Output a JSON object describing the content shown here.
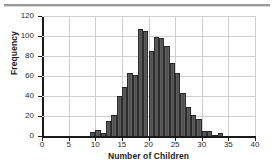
{
  "figure": {
    "background_color": "#ffffff",
    "rule_color": "#9a9a9a"
  },
  "chart_data": {
    "type": "bar",
    "title": "",
    "subtitle": "",
    "xlabel": "Number of Children",
    "ylabel": "Frequency",
    "xlim": [
      0,
      40
    ],
    "ylim": [
      0,
      120
    ],
    "grid": true,
    "legend": null,
    "bar_color": "#4c4c4c",
    "bar_edge_color": "#2b2b2b",
    "bin_width": 1,
    "xticks": [
      0,
      5,
      10,
      15,
      20,
      25,
      30,
      35,
      40
    ],
    "xtick_labels": [
      "0",
      "5",
      "10",
      "15",
      "20",
      "25",
      "30",
      "35",
      "40"
    ],
    "yticks": [
      0,
      20,
      40,
      60,
      80,
      100,
      120
    ],
    "ytick_labels": [
      "0",
      "20",
      "40",
      "60",
      "80",
      "100",
      "120"
    ],
    "categories": [
      9,
      10,
      11,
      12,
      13,
      14,
      15,
      16,
      17,
      18,
      19,
      20,
      21,
      22,
      23,
      24,
      25,
      26,
      27,
      28,
      29,
      30,
      31,
      32,
      33
    ],
    "values": [
      4,
      6,
      3,
      15,
      21,
      40,
      49,
      63,
      61,
      107,
      105,
      85,
      99,
      98,
      90,
      73,
      63,
      43,
      29,
      21,
      17,
      5,
      5,
      1,
      3
    ]
  }
}
